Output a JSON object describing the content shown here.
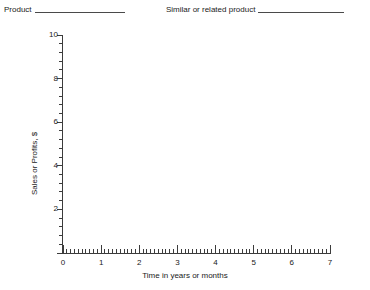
{
  "header": {
    "fields": [
      {
        "label": "Product",
        "value": ""
      },
      {
        "label": "Similar or related product",
        "value": ""
      }
    ]
  },
  "chart_data": {
    "type": "line",
    "title": "",
    "subtitle": "",
    "xlabel": "Time in years or months",
    "ylabel": "Sales or Profits, $",
    "xlim": [
      0,
      7
    ],
    "ylim": [
      0,
      10
    ],
    "x_ticks": [
      0,
      1,
      2,
      3,
      4,
      5,
      6,
      7
    ],
    "x_tick_labels": [
      "0",
      "1",
      "2",
      "3",
      "4",
      "5",
      "6",
      "7"
    ],
    "x_minor_per_interval": 10,
    "y_ticks": [
      0,
      2,
      4,
      6,
      8,
      10
    ],
    "y_tick_labels": [
      "",
      "2",
      "4",
      "6",
      "8",
      "10"
    ],
    "y_minor_per_interval": 5,
    "grid": false,
    "legend": null,
    "series": [],
    "annotations": [],
    "note": "Blank worksheet template; no data plotted in the axes."
  }
}
